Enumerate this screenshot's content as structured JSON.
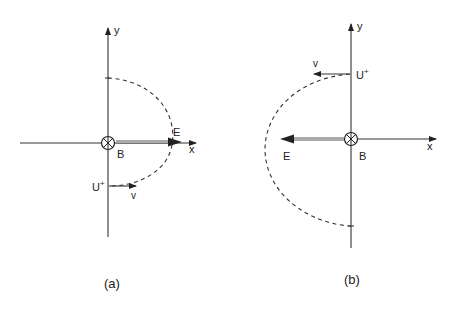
{
  "figure": {
    "panels": [
      {
        "id": "a",
        "caption": "(a)",
        "axes": {
          "x_label": "x",
          "y_label": "y"
        },
        "magnetic_field": {
          "label": "B",
          "symbol": "⊗",
          "direction": "into page"
        },
        "electric_field": {
          "label": "E",
          "direction": "+x"
        },
        "particle": {
          "label": "U",
          "charge_superscript": "+",
          "position": "negative y-axis"
        },
        "velocity": {
          "label": "v",
          "direction": "+x"
        },
        "trajectory": {
          "style": "dashed",
          "shape": "semi-ellipse bulging toward +x"
        }
      },
      {
        "id": "b",
        "caption": "(b)",
        "axes": {
          "x_label": "x",
          "y_label": "y"
        },
        "magnetic_field": {
          "label": "B",
          "symbol": "⊗",
          "direction": "into page"
        },
        "electric_field": {
          "label": "E",
          "direction": "-x"
        },
        "particle": {
          "label": "U",
          "charge_superscript": "+",
          "position": "positive y-axis"
        },
        "velocity": {
          "label": "v",
          "direction": "-x"
        },
        "trajectory": {
          "style": "dashed",
          "shape": "semi-ellipse bulging toward -x"
        }
      }
    ],
    "colors": {
      "line": "#333333",
      "efield": "#555555",
      "background": "#ffffff"
    }
  }
}
